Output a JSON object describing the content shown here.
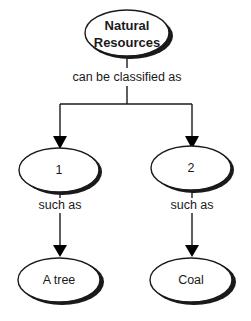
{
  "diagram": {
    "root": {
      "label_line1": "Natural",
      "label_line2": "Resources"
    },
    "root_link": "can be classified as",
    "branches": [
      {
        "category": "1",
        "link": "such as",
        "example": "A tree"
      },
      {
        "category": "2",
        "link": "such as",
        "example": "Coal"
      }
    ]
  }
}
